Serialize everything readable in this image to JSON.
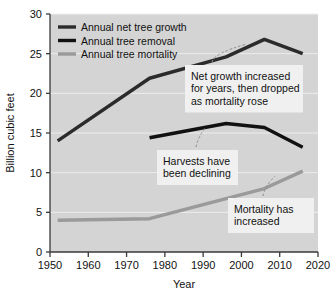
{
  "chart_data": {
    "type": "line",
    "title": "",
    "xlabel": "Year",
    "ylabel": "Billion cubic feet",
    "xlim": [
      1950,
      2020
    ],
    "ylim": [
      0,
      30
    ],
    "grid": true,
    "legend_position": "top-left",
    "xticks": [
      "1950",
      "1960",
      "1970",
      "1980",
      "1990",
      "2000",
      "2010",
      "2020"
    ],
    "yticks": [
      "0",
      "5",
      "10",
      "15",
      "20",
      "25",
      "30"
    ],
    "series": [
      {
        "name": "Annual net tree growth",
        "color": "#2b2b2b",
        "width": 3.4,
        "x": [
          1952,
          1976,
          1996,
          2006,
          2016
        ],
        "values": [
          14.0,
          21.9,
          24.6,
          26.8,
          25.0
        ]
      },
      {
        "name": "Annual tree removal",
        "color": "#111111",
        "width": 3.4,
        "x": [
          1976,
          1996,
          2006,
          2016
        ],
        "values": [
          14.4,
          16.2,
          15.7,
          13.2
        ]
      },
      {
        "name": "Annual tree mortality",
        "color": "#9a9a9a",
        "width": 3.4,
        "x": [
          1952,
          1976,
          2006,
          2016
        ],
        "values": [
          4.0,
          4.2,
          8.0,
          10.2
        ]
      }
    ],
    "annotations": [
      {
        "id": "growth-note",
        "lines": [
          "Net growth increased",
          "for years, then dropped",
          "as mortality rose"
        ],
        "target_x": 2006,
        "target_y": 26.8
      },
      {
        "id": "removal-note",
        "lines": [
          "Harvests have",
          "been declining"
        ],
        "target_x": 1998,
        "target_y": 16.0
      },
      {
        "id": "mortality-note",
        "lines": [
          "Mortality has",
          "increased"
        ],
        "target_x": 2009,
        "target_y": 8.6
      }
    ]
  },
  "colors": {
    "plot_background": "#d4d4d4",
    "page_background": "#ffffff",
    "gridline": "#ededed",
    "axis": "#3a3a3a",
    "callout_background": "#f0f0f0",
    "leader_line": "#8d8d8d"
  }
}
